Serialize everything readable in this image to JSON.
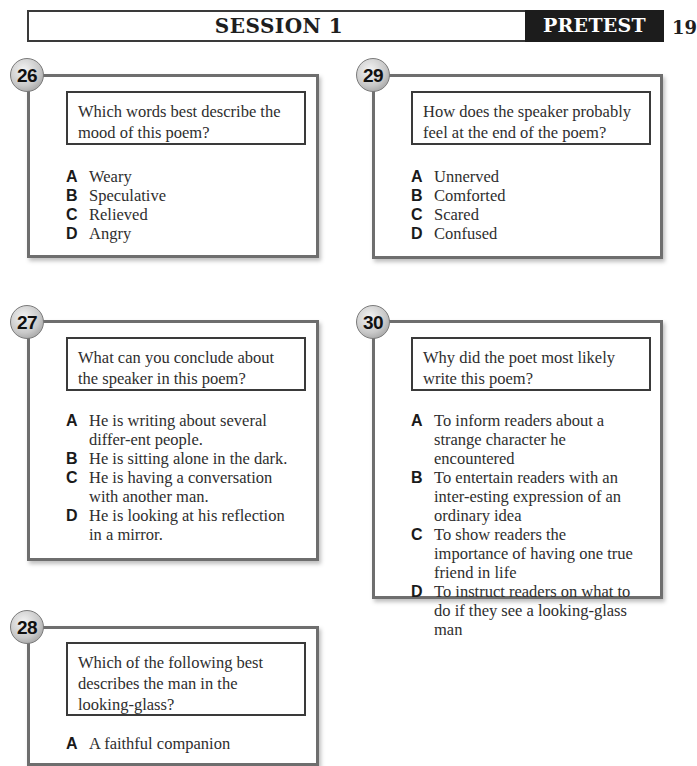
{
  "header": {
    "title": "SESSION 1",
    "tag": "PRETEST",
    "page_number": "19"
  },
  "questions": [
    {
      "number": "26",
      "prompt": "Which words best describe the mood of this poem?",
      "options": [
        {
          "letter": "A",
          "text": "Weary"
        },
        {
          "letter": "B",
          "text": "Speculative"
        },
        {
          "letter": "C",
          "text": "Relieved"
        },
        {
          "letter": "D",
          "text": "Angry"
        }
      ]
    },
    {
      "number": "27",
      "prompt": "What can you conclude about the speaker in this poem?",
      "options": [
        {
          "letter": "A",
          "text": "He is writing about several differ-ent people."
        },
        {
          "letter": "B",
          "text": "He is sitting alone in the dark."
        },
        {
          "letter": "C",
          "text": "He is having a conversation with another man."
        },
        {
          "letter": "D",
          "text": "He is looking at his reflection in a mirror."
        }
      ]
    },
    {
      "number": "28",
      "prompt": "Which of the following best describes the man in the looking-glass?",
      "options": [
        {
          "letter": "A",
          "text": "A faithful companion"
        }
      ]
    },
    {
      "number": "29",
      "prompt": "How does the speaker probably feel at the end of the poem?",
      "options": [
        {
          "letter": "A",
          "text": "Unnerved"
        },
        {
          "letter": "B",
          "text": "Comforted"
        },
        {
          "letter": "C",
          "text": "Scared"
        },
        {
          "letter": "D",
          "text": "Confused"
        }
      ]
    },
    {
      "number": "30",
      "prompt": "Why did the poet most likely write this poem?",
      "options": [
        {
          "letter": "A",
          "text": "To inform readers about a strange character he encountered"
        },
        {
          "letter": "B",
          "text": "To entertain readers with an inter-esting expression of an ordinary idea"
        },
        {
          "letter": "C",
          "text": "To show readers the importance of having one true friend in life"
        },
        {
          "letter": "D",
          "text": "To instruct readers on what to do if they see a looking-glass man"
        }
      ]
    }
  ]
}
